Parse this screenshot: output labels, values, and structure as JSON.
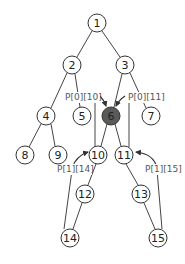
{
  "diagram": {
    "type": "tree",
    "colors": {
      "node_fill": "#ffffff",
      "highlight_fill": "#5a5a5a",
      "stroke": "#333333",
      "edge": "#444444",
      "label_text": "#555555"
    },
    "nodes": [
      {
        "id": "1",
        "label": "1",
        "x": 97,
        "y": 23,
        "highlight": false
      },
      {
        "id": "2",
        "label": "2",
        "x": 72,
        "y": 65,
        "highlight": false
      },
      {
        "id": "3",
        "label": "3",
        "x": 125,
        "y": 65,
        "highlight": false
      },
      {
        "id": "4",
        "label": "4",
        "x": 46,
        "y": 116,
        "highlight": false
      },
      {
        "id": "5",
        "label": "5",
        "x": 82,
        "y": 116,
        "highlight": false
      },
      {
        "id": "6",
        "label": "6",
        "x": 111,
        "y": 116,
        "highlight": true
      },
      {
        "id": "7",
        "label": "7",
        "x": 151,
        "y": 116,
        "highlight": false
      },
      {
        "id": "8",
        "label": "8",
        "x": 25,
        "y": 155,
        "highlight": false
      },
      {
        "id": "9",
        "label": "9",
        "x": 58,
        "y": 155,
        "highlight": false
      },
      {
        "id": "10",
        "label": "10",
        "x": 98,
        "y": 155,
        "highlight": false
      },
      {
        "id": "11",
        "label": "11",
        "x": 124,
        "y": 155,
        "highlight": false
      },
      {
        "id": "12",
        "label": "12",
        "x": 85,
        "y": 194,
        "highlight": false
      },
      {
        "id": "13",
        "label": "13",
        "x": 141,
        "y": 194,
        "highlight": false
      },
      {
        "id": "14",
        "label": "14",
        "x": 70,
        "y": 238,
        "highlight": false
      },
      {
        "id": "15",
        "label": "15",
        "x": 158,
        "y": 238,
        "highlight": false
      }
    ],
    "edges": [
      [
        "1",
        "2"
      ],
      [
        "1",
        "3"
      ],
      [
        "2",
        "4"
      ],
      [
        "2",
        "5"
      ],
      [
        "3",
        "6"
      ],
      [
        "3",
        "7"
      ],
      [
        "4",
        "8"
      ],
      [
        "4",
        "9"
      ],
      [
        "6",
        "10"
      ],
      [
        "6",
        "11"
      ],
      [
        "10",
        "12"
      ],
      [
        "12",
        "14"
      ],
      [
        "11",
        "13"
      ],
      [
        "13",
        "15"
      ]
    ],
    "pointer_labels": [
      {
        "text": "P[0][10]",
        "x": 66,
        "y": 100
      },
      {
        "text": "P[0][11]",
        "x": 128,
        "y": 100
      },
      {
        "text": "P[1][14]",
        "x": 57,
        "y": 172
      },
      {
        "text": "P[1][15]",
        "x": 145,
        "y": 172
      }
    ]
  }
}
